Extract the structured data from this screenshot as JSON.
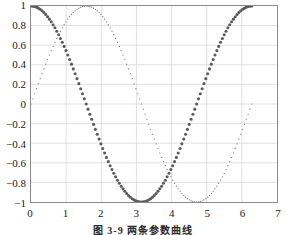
{
  "caption": {
    "text": "图 3-9   两条参数曲线"
  },
  "chart_data": {
    "type": "scatter",
    "title": "",
    "xlabel": "",
    "ylabel": "",
    "xlim": [
      0,
      7
    ],
    "ylim": [
      -1,
      1
    ],
    "grid": true,
    "legend_position": "none",
    "xticks": [
      0,
      1,
      2,
      3,
      4,
      5,
      6,
      7
    ],
    "xtick_labels": [
      "0",
      "1",
      "2",
      "3",
      "4",
      "5",
      "6",
      "7"
    ],
    "yticks": [
      -1,
      -0.8,
      -0.6,
      -0.4,
      -0.2,
      0,
      0.2,
      0.4,
      0.6,
      0.8,
      1
    ],
    "ytick_labels": [
      "−1",
      "−0.8",
      "−0.6",
      "−0.4",
      "−0.2",
      "0",
      "0.2",
      "0.4",
      "0.6",
      "0.8",
      "1"
    ],
    "x_range_data": [
      0,
      6.2832
    ],
    "n_points": 121,
    "series": [
      {
        "name": "cos(x)",
        "function": "cos",
        "marker": "bold-dot",
        "marker_size": 3.1,
        "color": "#5a5a5a",
        "start_value": 1,
        "min_value": -1,
        "min_at_x": 3.1416,
        "end_value": 1
      },
      {
        "name": "sin(x)",
        "function": "sin",
        "marker": "fine-dot",
        "marker_size": 1.25,
        "color": "#707070",
        "start_value": 0,
        "max_value": 1,
        "max_at_x": 1.5708,
        "min_value": -1,
        "min_at_x": 4.7124,
        "end_value": 0
      }
    ]
  },
  "style": {
    "axis_color": "#8a8a8a",
    "grid_color": "#d8d8d8",
    "text_color": "#1a1a1a",
    "background": "#ffffff"
  }
}
